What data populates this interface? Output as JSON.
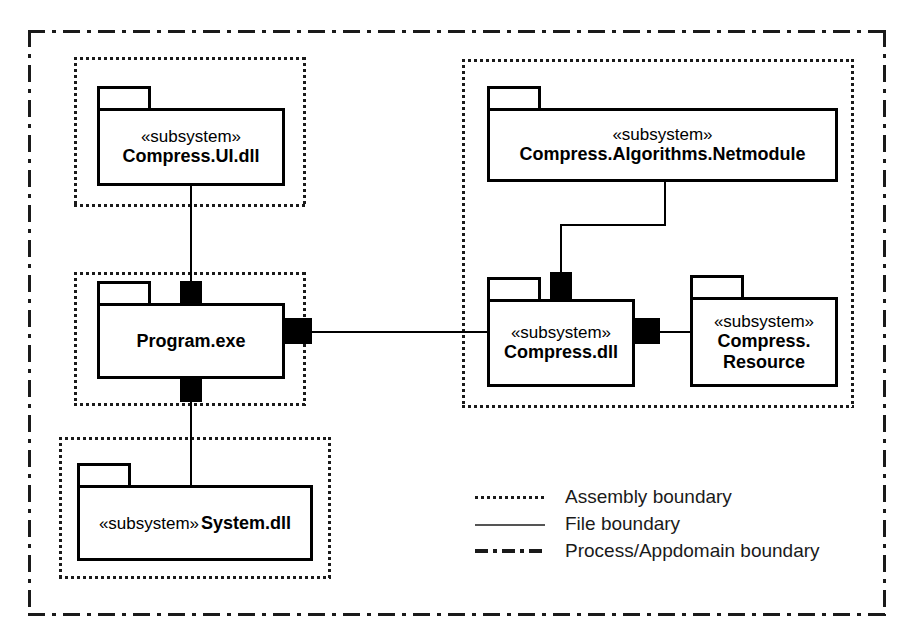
{
  "diagram": {
    "stereotype": "«subsystem»"
  },
  "packages": {
    "compress_ui": {
      "stereotype": "«subsystem»",
      "name": "Compress.UI.dll"
    },
    "program": {
      "stereotype": "",
      "name": "Program.exe"
    },
    "system": {
      "stereotype": "«subsystem»",
      "name": "System.dll"
    },
    "netmodule": {
      "stereotype": "«subsystem»",
      "name": "Compress.Algorithms.Netmodule"
    },
    "compress_dll": {
      "stereotype": "«subsystem»",
      "name": "Compress.dll"
    },
    "compress_resource": {
      "stereotype": "«subsystem»",
      "name_line1": "Compress.",
      "name_line2": "Resource"
    }
  },
  "legend": {
    "rows": [
      {
        "style": "dotted",
        "label": "Assembly boundary"
      },
      {
        "style": "solid",
        "label": "File boundary"
      },
      {
        "style": "dash-dot",
        "label": "Process/Appdomain boundary"
      }
    ]
  },
  "colors": {
    "line": "#000000",
    "boundary": "#1a1a1a",
    "background": "#ffffff"
  }
}
